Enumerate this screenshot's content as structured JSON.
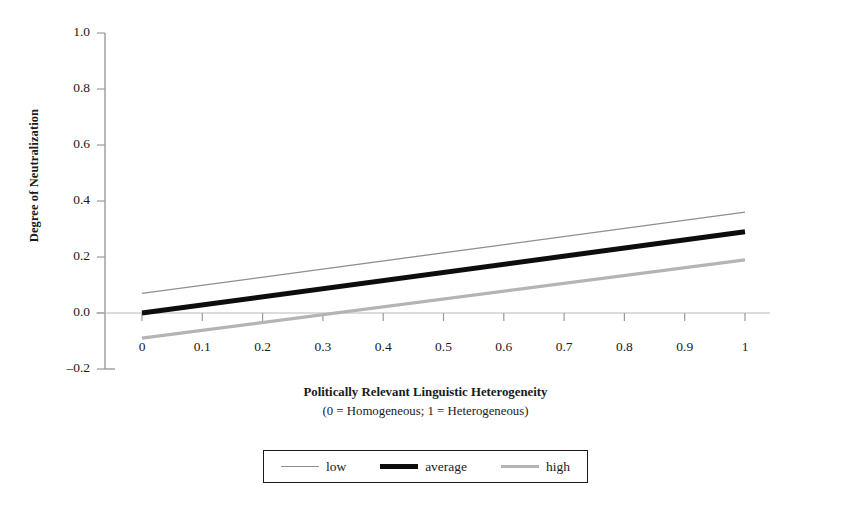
{
  "chart_data": {
    "type": "line",
    "title": "",
    "xlabel": "Politically Relevant Linguistic Heterogeneity",
    "xsublabel": "(0 = Homogeneous; 1 = Heterogeneous)",
    "ylabel": "Degree of Neutralization",
    "xlim": [
      0,
      1
    ],
    "ylim": [
      -0.2,
      1.0
    ],
    "grid": false,
    "legend_position": "below-center",
    "xticks": [
      "0",
      "0.1",
      "0.2",
      "0.3",
      "0.4",
      "0.5",
      "0.6",
      "0.7",
      "0.8",
      "0.9",
      "1"
    ],
    "xtick_values": [
      0,
      0.1,
      0.2,
      0.3,
      0.4,
      0.5,
      0.6,
      0.7,
      0.8,
      0.9,
      1
    ],
    "yticks": [
      "1.0",
      "0.8",
      "0.6",
      "0.4",
      "0.2",
      "0.0",
      "–0.2"
    ],
    "ytick_values": [
      1.0,
      0.8,
      0.6,
      0.4,
      0.2,
      0.0,
      -0.2
    ],
    "x": [
      0,
      1
    ],
    "series": [
      {
        "name": "low",
        "color": "#8e8e8e",
        "width": 1.3,
        "values": [
          0.07,
          0.36
        ]
      },
      {
        "name": "average",
        "color": "#0d0d0d",
        "width": 5.0,
        "values": [
          0.0,
          0.29
        ]
      },
      {
        "name": "high",
        "color": "#b4b4b4",
        "width": 3.2,
        "values": [
          -0.09,
          0.19
        ]
      }
    ],
    "axis_color": "#9a9a9a",
    "zero_line": 0.0
  },
  "legend": {
    "entries": [
      {
        "label": "low"
      },
      {
        "label": "average"
      },
      {
        "label": "high"
      }
    ]
  }
}
